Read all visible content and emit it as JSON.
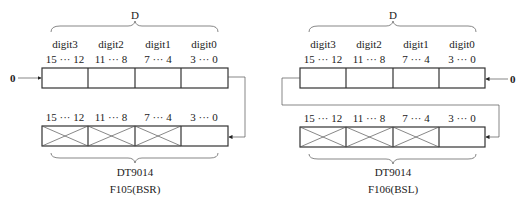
{
  "diagrams": [
    {
      "id": "bsr",
      "brace_label": "D",
      "digits": [
        "digit3",
        "digit2",
        "digit1",
        "digit0"
      ],
      "bit_ranges": [
        "15 ··· 12",
        "11 ··· 8",
        "7 ··· 4",
        "3 ··· 0"
      ],
      "input_value": "0",
      "lower_bit_ranges": [
        "15 ··· 12",
        "11 ··· 8",
        "7 ··· 4",
        "3 ··· 0"
      ],
      "register_label": "DT9014",
      "caption": "F105(BSR)"
    },
    {
      "id": "bsl",
      "brace_label": "D",
      "digits": [
        "digit3",
        "digit2",
        "digit1",
        "digit0"
      ],
      "bit_ranges": [
        "15 ··· 12",
        "11 ··· 8",
        "7 ··· 4",
        "3 ··· 0"
      ],
      "input_value": "0",
      "lower_bit_ranges": [
        "15 ··· 12",
        "11 ··· 8",
        "7 ··· 4",
        "3 ··· 0"
      ],
      "register_label": "DT9014",
      "caption": "F106(BSL)"
    }
  ]
}
